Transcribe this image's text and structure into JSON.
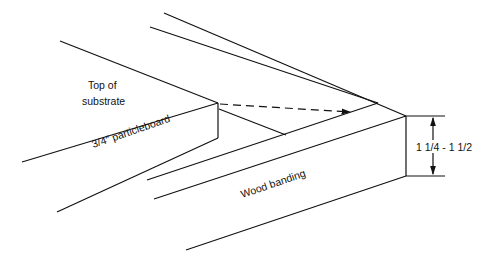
{
  "diagram": {
    "type": "technical-drawing",
    "labels": {
      "top_of_substrate_line1": "Top of",
      "top_of_substrate_line2": "substrate",
      "particleboard": "3/4″ particleboard",
      "wood_banding": "Wood banding",
      "dimension": "1 1/4 - 1 1/2"
    },
    "colors": {
      "line": "#111111",
      "background": "#ffffff"
    }
  }
}
